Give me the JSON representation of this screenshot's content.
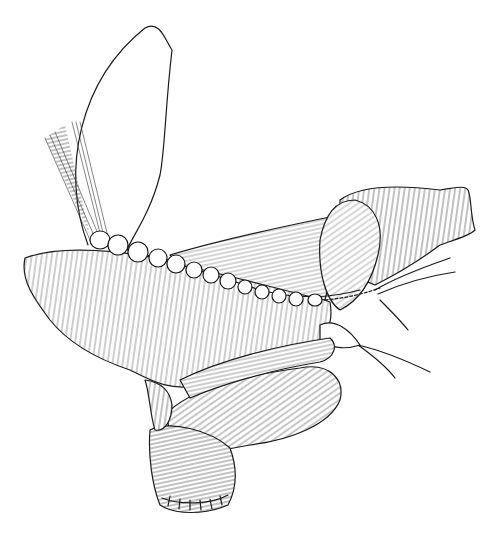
{
  "illustration": {
    "subject": "surgical line drawing of intestine with sutured anastomosis",
    "colors": {
      "background": "#ffffff",
      "ink": "#1a1a1a"
    }
  }
}
